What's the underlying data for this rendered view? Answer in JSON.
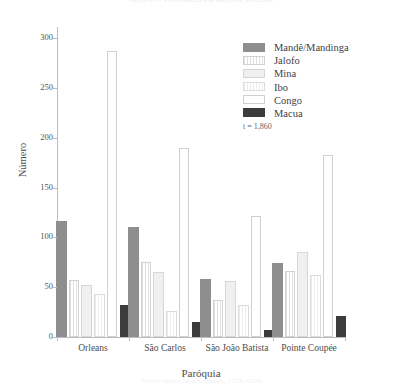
{
  "figure": {
    "cut_title": "Gráfico — Procedência dos escravos africanos",
    "cut_footer": "Fonte: registros paroquiais, 1718-1820"
  },
  "chart_data": {
    "type": "bar",
    "title": "",
    "xlabel": "Paróquia",
    "ylabel": "Número",
    "ylim": [
      0,
      300
    ],
    "yticks": [
      0,
      50,
      100,
      150,
      200,
      250,
      300
    ],
    "ytick_labels": [
      "0",
      "50",
      "100",
      "150",
      "200",
      "250",
      "300"
    ],
    "grid": false,
    "legend_position": "upper right",
    "annotation": "t = 1,860",
    "categories": [
      "Orleans",
      "São Carlos",
      "São João Batista",
      "Pointe Coupée"
    ],
    "series": [
      {
        "name": "Mandê/Mandinga",
        "values": [
          116,
          110,
          58,
          74
        ],
        "fill": "solid-gray",
        "color": "#8e8e8e"
      },
      {
        "name": "Jalofo",
        "values": [
          57,
          75,
          37,
          66
        ],
        "fill": "vertical-hatch",
        "color": "#e0e0e0"
      },
      {
        "name": "Mina",
        "values": [
          52,
          65,
          56,
          85
        ],
        "fill": "light-solid",
        "color": "#f0f0f0"
      },
      {
        "name": "Ibo",
        "values": [
          43,
          26,
          32,
          62
        ],
        "fill": "stipple",
        "color": "#ededed"
      },
      {
        "name": "Congo",
        "values": [
          287,
          190,
          121,
          183
        ],
        "fill": "outline-white",
        "color": "#ffffff"
      },
      {
        "name": "Macua",
        "values": [
          32,
          15,
          7,
          21
        ],
        "fill": "solid-dark",
        "color": "#3c3c3c"
      }
    ]
  }
}
